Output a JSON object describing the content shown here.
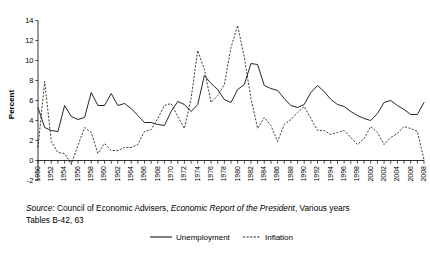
{
  "chart_data": {
    "type": "line",
    "title": "",
    "xlabel": "",
    "ylabel": "Percent",
    "ylim": [
      -2,
      14
    ],
    "xlim": [
      1950,
      2008
    ],
    "ytick_step": 2,
    "xtick_label_step": 2,
    "grid": false,
    "legend_position": "bottom",
    "yticks": [
      -2,
      0,
      2,
      4,
      6,
      8,
      10,
      12,
      14
    ],
    "x": [
      1950,
      1951,
      1952,
      1953,
      1954,
      1955,
      1956,
      1957,
      1958,
      1959,
      1960,
      1961,
      1962,
      1963,
      1964,
      1965,
      1966,
      1967,
      1968,
      1969,
      1970,
      1971,
      1972,
      1973,
      1974,
      1975,
      1976,
      1977,
      1978,
      1979,
      1980,
      1981,
      1982,
      1983,
      1984,
      1985,
      1986,
      1987,
      1988,
      1989,
      1990,
      1991,
      1992,
      1993,
      1994,
      1995,
      1996,
      1997,
      1998,
      1999,
      2000,
      2001,
      2002,
      2003,
      2004,
      2005,
      2006,
      2007,
      2008
    ],
    "xtick_labels": [
      "1950",
      "1952",
      "1954",
      "1956",
      "1958",
      "1960",
      "1962",
      "1964",
      "1966",
      "1968",
      "1970",
      "1972",
      "1974",
      "1976",
      "1978",
      "1980",
      "1982",
      "1984",
      "1986",
      "1988",
      "1990",
      "1992",
      "1994",
      "1996",
      "1998",
      "2000",
      "2002",
      "2004",
      "2006",
      "2008"
    ],
    "series": [
      {
        "name": "Unemployment",
        "style": "solid",
        "values": [
          5.3,
          3.3,
          3.0,
          2.9,
          5.5,
          4.4,
          4.1,
          4.3,
          6.8,
          5.5,
          5.5,
          6.7,
          5.5,
          5.7,
          5.2,
          4.5,
          3.8,
          3.8,
          3.6,
          3.5,
          4.9,
          5.9,
          5.6,
          4.9,
          5.6,
          8.5,
          7.7,
          7.1,
          6.1,
          5.8,
          7.1,
          7.6,
          9.7,
          9.6,
          7.5,
          7.2,
          7.0,
          6.2,
          5.5,
          5.3,
          5.6,
          6.8,
          7.5,
          6.9,
          6.1,
          5.6,
          5.4,
          4.9,
          4.5,
          4.2,
          4.0,
          4.7,
          5.8,
          6.0,
          5.5,
          5.1,
          4.6,
          4.6,
          5.8
        ]
      },
      {
        "name": "Inflation",
        "style": "dashed",
        "values": [
          1.3,
          7.9,
          1.9,
          0.8,
          0.7,
          -0.4,
          1.5,
          3.3,
          2.8,
          0.7,
          1.7,
          1.0,
          1.0,
          1.3,
          1.3,
          1.6,
          2.9,
          3.1,
          4.2,
          5.5,
          5.7,
          4.4,
          3.2,
          6.2,
          11.0,
          9.1,
          5.8,
          6.5,
          7.6,
          11.3,
          13.5,
          10.3,
          6.2,
          3.2,
          4.3,
          3.5,
          1.9,
          3.6,
          4.1,
          4.8,
          5.4,
          4.2,
          3.0,
          3.0,
          2.6,
          2.8,
          3.0,
          2.3,
          1.6,
          2.2,
          3.4,
          2.8,
          1.6,
          2.3,
          2.7,
          3.4,
          3.2,
          2.9,
          0.1
        ]
      }
    ]
  },
  "axis": {
    "y_title": "Percent"
  },
  "legend": {
    "items": [
      {
        "label": "Unemployment",
        "style": "solid"
      },
      {
        "label": "Inflation",
        "style": "dashed"
      }
    ]
  },
  "source": {
    "label": "Source",
    "colon": ":",
    "organization": " Council of Economic Advisers, ",
    "publication": "Economic Report of the President",
    "suffix": ", Various years",
    "tables": "Tables B-42, 63"
  },
  "colors": {
    "line": "#1a1a1a",
    "background": "#ffffff",
    "text": "#000000"
  }
}
